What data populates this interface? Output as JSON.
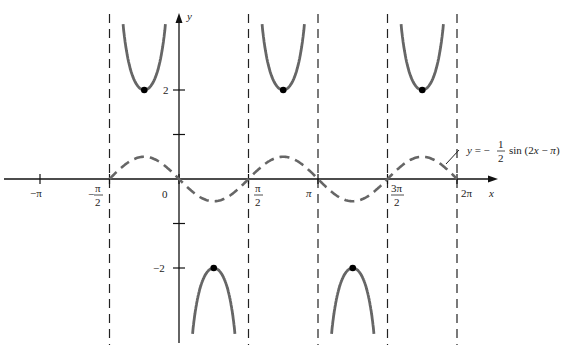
{
  "chart_data": {
    "type": "line",
    "title": "",
    "xlabel": "x",
    "ylabel": "y",
    "xlim": [
      -3.55,
      7.0
    ],
    "ylim": [
      -3.8,
      4.0
    ],
    "grid": false,
    "x_ticks": [
      {
        "value": -3.14159,
        "label": "−π"
      },
      {
        "value": -1.5708,
        "label": "−π/2"
      },
      {
        "value": 0,
        "label": "0"
      },
      {
        "value": 1.5708,
        "label": "π/2"
      },
      {
        "value": 3.14159,
        "label": "π"
      },
      {
        "value": 4.7124,
        "label": "3π/2"
      },
      {
        "value": 6.28319,
        "label": "2π"
      }
    ],
    "y_ticks": [
      {
        "value": 2,
        "label": "2"
      },
      {
        "value": 1,
        "label": ""
      },
      {
        "value": -1,
        "label": ""
      },
      {
        "value": -2,
        "label": "−2"
      }
    ],
    "series": [
      {
        "name": "y = −½ sin(2x − π)",
        "style": "dashed",
        "domain": [
          -1.5708,
          6.28319
        ],
        "amplitude": 0.5,
        "peaks_at": [
          -0.785,
          2.356,
          5.498
        ],
        "troughs_at": [
          0.785,
          3.927
        ]
      },
      {
        "name": "reciprocal (cosecant) branches",
        "style": "solid",
        "upper_branch_minima": [
          [
            -0.785,
            2
          ],
          [
            2.356,
            2
          ],
          [
            5.498,
            2
          ]
        ],
        "lower_branch_maxima": [
          [
            0.785,
            -2
          ],
          [
            3.927,
            -2
          ]
        ]
      }
    ],
    "asymptotes": [
      -1.5708,
      0,
      1.5708,
      3.14159,
      4.7124,
      6.28319
    ],
    "marked_points": [
      [
        -0.785,
        2
      ],
      [
        2.356,
        2
      ],
      [
        5.498,
        2
      ],
      [
        0.785,
        -2
      ],
      [
        3.927,
        -2
      ]
    ],
    "annotation": {
      "text_prefix": "y = −",
      "frac_num": "1",
      "frac_den": "2",
      "text_suffix": "sin (2x − π)"
    }
  },
  "labels": {
    "x_axis": "x",
    "y_axis": "y",
    "neg_pi": "−π",
    "neg_half_pi_num": "π",
    "neg_half_pi_den": "2",
    "neg_sign": "−",
    "zero": "0",
    "half_pi_num": "π",
    "half_pi_den": "2",
    "pi": "π",
    "three_half_pi_num": "3π",
    "three_half_pi_den": "2",
    "two_pi": "2π",
    "y_two": "2",
    "y_neg_two": "−2"
  }
}
